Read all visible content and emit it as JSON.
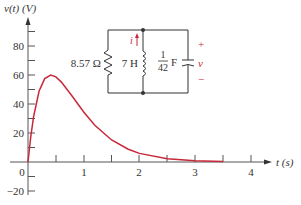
{
  "chart_data": {
    "type": "line",
    "title": "",
    "xlabel": "t (s)",
    "ylabel": "v(t) (V)",
    "xlim": [
      0,
      4.3
    ],
    "ylim": [
      -20,
      95
    ],
    "x_ticks": [
      "0",
      "1",
      "2",
      "3",
      "4"
    ],
    "y_ticks": [
      "−20",
      "20",
      "40",
      "60",
      "80"
    ],
    "grid": false,
    "series": [
      {
        "name": "v(t)",
        "color": "#c8283a",
        "x": [
          0,
          0.05,
          0.1,
          0.2,
          0.3,
          0.408,
          0.5,
          0.6,
          0.8,
          1.0,
          1.2,
          1.5,
          1.8,
          2.0,
          2.5,
          3.0,
          3.5
        ],
        "values": [
          0,
          17.7,
          31.3,
          49.0,
          57.5,
          60.0,
          58.7,
          55.1,
          45.0,
          34.5,
          25.4,
          15.2,
          8.8,
          5.9,
          2.3,
          0.8,
          0.3
        ]
      }
    ],
    "annotations": [
      "critically damped parallel RLC response"
    ]
  },
  "circuit": {
    "resistor_label": "8.57 Ω",
    "inductor_label": "7 H",
    "capacitor_num": "1",
    "capacitor_den": "42",
    "capacitor_unit": "F",
    "current_label": "i",
    "voltage_label": "v",
    "plus": "+",
    "minus": "−"
  },
  "colors": {
    "curve": "#c8283a",
    "axis": "#555555",
    "circuit": "#333333",
    "accent": "#c8283a"
  }
}
